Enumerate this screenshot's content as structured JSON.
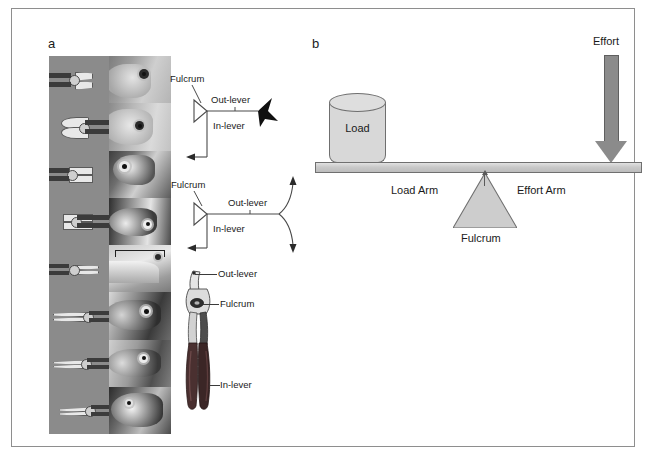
{
  "figure": {
    "panels": [
      {
        "id": "a",
        "label": "a"
      },
      {
        "id": "b",
        "label": "b"
      }
    ]
  },
  "panel_a": {
    "label": "a",
    "montage": {
      "rows": 8,
      "columns": [
        "pliers-photo",
        "fish-head-photo"
      ],
      "plier_items": [
        {
          "name": "plier-row-1"
        },
        {
          "name": "plier-row-2"
        },
        {
          "name": "plier-row-3"
        },
        {
          "name": "plier-row-4"
        },
        {
          "name": "plier-row-5"
        },
        {
          "name": "plier-row-6"
        },
        {
          "name": "plier-row-7"
        },
        {
          "name": "plier-row-8"
        }
      ],
      "fish_items": [
        {
          "name": "fish-row-1"
        },
        {
          "name": "fish-row-2"
        },
        {
          "name": "fish-row-3"
        },
        {
          "name": "fish-row-4"
        },
        {
          "name": "fish-row-5"
        },
        {
          "name": "fish-row-6"
        },
        {
          "name": "fish-row-7"
        },
        {
          "name": "fish-row-8"
        }
      ]
    },
    "lever_diagram_top": {
      "fulcrum_label": "Fulcrum",
      "out_lever_label": "Out-lever",
      "in_lever_label": "In-lever"
    },
    "lever_diagram_bottom": {
      "fulcrum_label": "Fulcrum",
      "out_lever_label": "Out-lever",
      "in_lever_label": "In-lever"
    },
    "pliers_illustration": {
      "out_lever_label": "Out-lever",
      "fulcrum_label": "Fulcrum",
      "in_lever_label": "In-lever"
    }
  },
  "panel_b": {
    "label": "b",
    "load_label": "Load",
    "effort_label": "Effort",
    "load_arm_label": "Load Arm",
    "effort_arm_label": "Effort Arm",
    "fulcrum_label": "Fulcrum"
  },
  "colors": {
    "frame_border": "#8e8e8e",
    "beam_fill": "#c9c9c9",
    "beam_stroke": "#6f6f6f",
    "load_fill": "#d8d8d8",
    "fulcrum_fill": "#cdcdcd",
    "effort_arrow": "#8b8b8b",
    "photo_background": "#8b8b8b",
    "schematic_stroke": "#4a4a4a",
    "text": "#1a1a1a"
  }
}
